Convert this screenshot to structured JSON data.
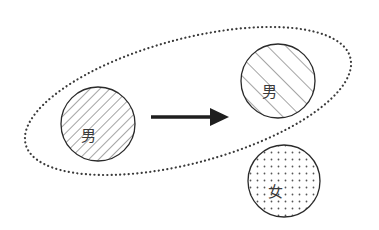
{
  "diagram": {
    "type": "relationship-diagram",
    "group": {
      "shape": "ellipse",
      "style": "dotted",
      "contains": [
        "left-male",
        "top-right-male"
      ]
    },
    "nodes": [
      {
        "id": "left-male",
        "label": "男",
        "fill": "diagonal-hatch-narrow-backslash"
      },
      {
        "id": "top-right-male",
        "label": "男",
        "fill": "diagonal-hatch-wide-slash"
      },
      {
        "id": "bottom-right-female",
        "label": "女",
        "fill": "dot-grid"
      }
    ],
    "edges": [
      {
        "from": "left-male",
        "to": "top-right-male",
        "style": "solid-arrow"
      }
    ],
    "colors": {
      "stroke": "#2a2a2a",
      "hatch": "#4a4a4a",
      "dots": "#555555",
      "background": "#ffffff"
    }
  }
}
